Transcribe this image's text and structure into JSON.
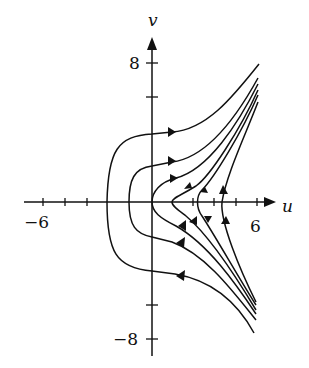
{
  "figure": {
    "type": "phase-portrait",
    "axes": {
      "x_label": "u",
      "y_label": "v",
      "x_tick_labels": [
        "−6",
        "6"
      ],
      "y_tick_labels": [
        "8",
        "−8"
      ]
    },
    "colors": {
      "ink": "#111111",
      "background": "#ffffff"
    }
  }
}
